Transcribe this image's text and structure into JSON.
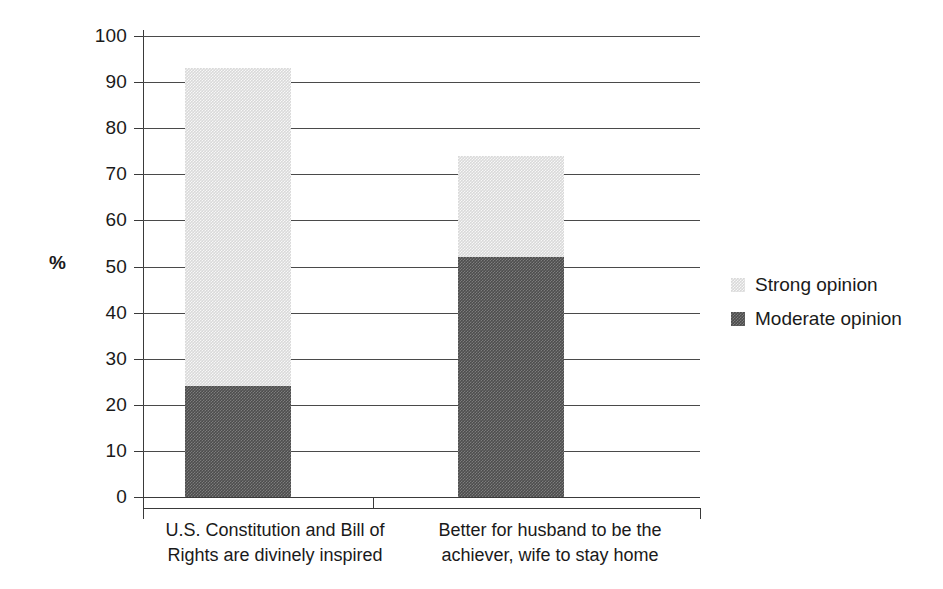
{
  "chart_data": {
    "type": "bar",
    "subtype": "stacked-bar",
    "title": "",
    "xlabel": "",
    "ylabel": "%",
    "ylim": [
      0,
      100
    ],
    "ytick_step": 10,
    "yticks": [
      100,
      90,
      80,
      70,
      60,
      50,
      40,
      30,
      20,
      10,
      0
    ],
    "ytick_labels": [
      "100",
      "90",
      "80",
      "70",
      "60",
      "50",
      "40",
      "30",
      "20",
      "10",
      "0"
    ],
    "grid": true,
    "grid_axis": "y",
    "legend_position": "right",
    "categories": [
      "U.S. Constitution and Bill of Rights are divinely inspired",
      "Better for husband to be the achiever, wife to stay home"
    ],
    "category_lines": [
      [
        "U.S. Constitution and Bill of",
        "Rights are divinely inspired"
      ],
      [
        "Better for husband to be the",
        "achiever, wife to stay home"
      ]
    ],
    "series": [
      {
        "name": "Strong opinion",
        "color": "#d9d9d9",
        "values": [
          69,
          22
        ]
      },
      {
        "name": "Moderate opinion",
        "color": "#4d4d4d",
        "values": [
          24,
          52
        ]
      }
    ],
    "totals": [
      93,
      74
    ]
  },
  "axis": {
    "y_title": "%"
  },
  "legend": {
    "items": [
      {
        "label": "Strong opinion",
        "swatch": "legend-swatch-strong"
      },
      {
        "label": "Moderate opinion",
        "swatch": "legend-swatch-moderate"
      }
    ]
  }
}
